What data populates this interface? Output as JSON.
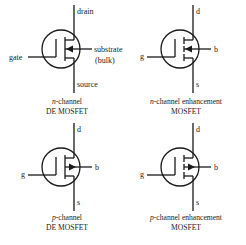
{
  "diagram": {
    "symbols": [
      {
        "id": "n-de",
        "channel": "n",
        "type": "depletion-enhancement",
        "labels": {
          "drain": "drain",
          "gate": "gate",
          "substrate": "substrate",
          "bulk": "(bulk)",
          "source": "source"
        },
        "caption_italic": "n",
        "caption_line1_rest": "-channel",
        "caption_line2": "DE MOSFET",
        "arrow_direction": "inward",
        "channel_style": "continuous"
      },
      {
        "id": "n-enh",
        "channel": "n",
        "type": "enhancement",
        "labels": {
          "drain": "d",
          "gate": "g",
          "substrate": "b",
          "source": "s"
        },
        "caption_italic": "n",
        "caption_line1_rest": "-channel enhancement",
        "caption_line2": "MOSFET",
        "arrow_direction": "inward",
        "channel_style": "broken"
      },
      {
        "id": "p-de",
        "channel": "p",
        "type": "depletion-enhancement",
        "labels": {
          "drain": "d",
          "gate": "g",
          "substrate": "b",
          "source": "s"
        },
        "caption_italic": "p",
        "caption_line1_rest": "-channel",
        "caption_line2": "DE MOSFET",
        "arrow_direction": "outward",
        "channel_style": "continuous"
      },
      {
        "id": "p-enh",
        "channel": "p",
        "type": "enhancement",
        "labels": {
          "drain": "d",
          "gate": "g",
          "substrate": "b",
          "source": "s"
        },
        "caption_italic": "p",
        "caption_line1_rest": "-channel enhancement",
        "caption_line2": "MOSFET",
        "arrow_direction": "outward",
        "channel_style": "broken"
      }
    ]
  }
}
